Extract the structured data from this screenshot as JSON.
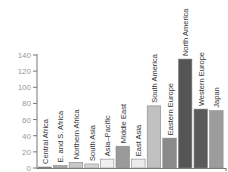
{
  "chart_data": {
    "type": "bar",
    "title": "",
    "xlabel": "",
    "ylabel": "",
    "ylim": [
      0,
      140
    ],
    "yticks": [
      0,
      20,
      40,
      60,
      80,
      100,
      120,
      140
    ],
    "grid": false,
    "legend": null,
    "categories": [
      "Central Africa",
      "E. and S. Africa",
      "Northern Africa",
      "South Asia",
      "Asia–Pacific",
      "Middle East",
      "East Asia",
      "South America",
      "Eastern Europe",
      "North America",
      "Western Europe",
      "Japan"
    ],
    "values": [
      1,
      3,
      7,
      5,
      11,
      27,
      11,
      77,
      37,
      135,
      73,
      71
    ],
    "colors": [
      "#6b6b6b",
      "#a8a8a8",
      "#c8c8c8",
      "#d4d4d4",
      "#f0f0f0",
      "#9a9a9a",
      "#ececec",
      "#c0c0c0",
      "#8a8a8a",
      "#555555",
      "#5a5a5a",
      "#9c9c9c"
    ],
    "label_placement": "rotated above bar"
  }
}
